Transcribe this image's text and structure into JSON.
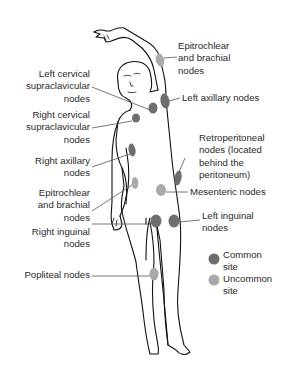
{
  "colors": {
    "common_site": "#6e6e6e",
    "uncommon_site": "#a9a9a9",
    "outline": "#111111",
    "leader_line": "#555555",
    "text": "#2a2a2a"
  },
  "labels": {
    "epitrochlear_brachial_left": "Epitrochlear\nand brachial\nnodes",
    "left_cervical_supraclavicular": "Left cervical\nsupraclavicular\nnodes",
    "left_axillary": "Left axillary nodes",
    "right_cervical_supraclavicular": "Right cervical\nsupraclavicular\nnodes",
    "retroperitoneal": "Retroperitoneal\nnodes (located\nbehind the\nperitoneum)",
    "right_axillary": "Right axillary\nnodes",
    "epitrochlear_brachial_right": "Epitrochlear\nand brachial\nnodes",
    "mesenteric": "Mesenteric nodes",
    "left_inguinal": "Left inguinal\nnodes",
    "right_inguinal": "Right inguinal\nnodes",
    "popliteal": "Popliteal nodes"
  },
  "legend": {
    "items": [
      {
        "label": "Common\nsite",
        "icon": "common-site-dot"
      },
      {
        "label": "Uncommon\nsite",
        "icon": "uncommon-site-dot"
      }
    ]
  },
  "nodes": [
    {
      "name": "epitrochlear-brachial-left",
      "type": "uncommon"
    },
    {
      "name": "left-cervical-supraclavicular",
      "type": "common"
    },
    {
      "name": "right-cervical-supraclavicular",
      "type": "common"
    },
    {
      "name": "left-axillary",
      "type": "common"
    },
    {
      "name": "right-axillary",
      "type": "common"
    },
    {
      "name": "epitrochlear-brachial-right",
      "type": "uncommon"
    },
    {
      "name": "retroperitoneal",
      "type": "common"
    },
    {
      "name": "mesenteric",
      "type": "uncommon"
    },
    {
      "name": "right-inguinal",
      "type": "common"
    },
    {
      "name": "left-inguinal",
      "type": "common"
    },
    {
      "name": "popliteal",
      "type": "uncommon"
    }
  ]
}
